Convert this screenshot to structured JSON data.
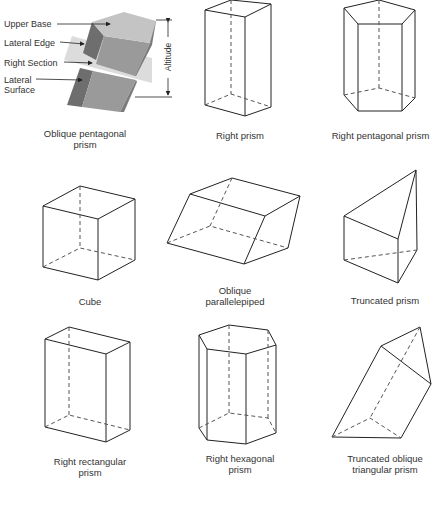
{
  "figure": {
    "labels": {
      "upper_base": "Upper Base",
      "lateral_edge": "Lateral Edge",
      "right_section": "Right Section",
      "lateral_surface": "Lateral\nSurface",
      "altitude": "Altitude"
    },
    "captions": [
      {
        "id": "oblique-pentagonal-prism",
        "text": "Oblique pentagonal\nprism"
      },
      {
        "id": "right-prism",
        "text": "Right prism"
      },
      {
        "id": "right-pentagonal-prism",
        "text": "Right pentagonal prism"
      },
      {
        "id": "cube",
        "text": "Cube"
      },
      {
        "id": "oblique-parallelepiped",
        "text": "Oblique\nparallelepiped"
      },
      {
        "id": "truncated-prism",
        "text": "Truncated prism"
      },
      {
        "id": "right-rectangular-prism",
        "text": "Right rectangular\nprism"
      },
      {
        "id": "right-hexagonal-prism",
        "text": "Right hexagonal\nprism"
      },
      {
        "id": "truncated-oblique-triangular-prism",
        "text": "Truncated oblique\ntriangular prism"
      }
    ],
    "colors": {
      "line": "#222222",
      "hidden_line": "#555555",
      "top_face": "#c4c4c4",
      "front_face": "#9a9a9a",
      "side_face": "#6e6e6e",
      "section_plane": "#d6d6d6"
    }
  }
}
